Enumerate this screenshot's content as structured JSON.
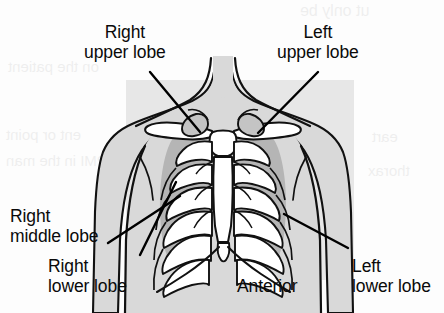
{
  "figure": {
    "view_label": "Anterior",
    "background_color": "#ffffff",
    "page_block_color": "#e3e3e3",
    "line_color": "#000000",
    "lung_shade_color": "#b9b9b9",
    "bone_fill_color": "#ffffff"
  },
  "labels": [
    {
      "id": "right-upper-lobe",
      "lines": [
        "Right",
        "upper lobe"
      ],
      "align": "center",
      "x": 84,
      "y": 22,
      "leader": {
        "from_x": 150,
        "from_y": 72,
        "to_x": 200,
        "to_y": 132
      }
    },
    {
      "id": "left-upper-lobe",
      "lines": [
        "Left",
        "upper lobe"
      ],
      "align": "center",
      "x": 277,
      "y": 22,
      "leader": {
        "from_x": 318,
        "from_y": 72,
        "to_x": 258,
        "to_y": 133
      }
    },
    {
      "id": "right-middle-lobe",
      "lines": [
        "Right",
        "middle lobe"
      ],
      "align": "left",
      "x": 10,
      "y": 206,
      "leader": {
        "from_x": 108,
        "from_y": 243,
        "to_x": 180,
        "to_y": 196
      }
    },
    {
      "id": "right-lower-lobe",
      "lines": [
        "Right",
        "lower lobe"
      ],
      "align": "left",
      "x": 48,
      "y": 256,
      "leader": {
        "from_x": 140,
        "from_y": 255,
        "to_x": 176,
        "to_y": 182
      }
    },
    {
      "id": "left-lower-lobe",
      "lines": [
        "Left",
        "lower lobe"
      ],
      "align": "left",
      "x": 352,
      "y": 256,
      "leader": {
        "from_x": 348,
        "from_y": 248,
        "to_x": 284,
        "to_y": 214
      }
    }
  ],
  "view_label": {
    "text": "Anterior",
    "x": 237,
    "y": 276
  },
  "ghost_text": [
    {
      "id": "ghost-top-right",
      "text": "ut only be",
      "x": 300,
      "y": 2,
      "size": 16
    },
    {
      "id": "ghost-upper-left",
      "text": "on the patient",
      "x": 8,
      "y": 58,
      "size": 15
    },
    {
      "id": "ghost-mid-left-1",
      "text": "ent or point",
      "x": 6,
      "y": 126,
      "size": 15
    },
    {
      "id": "ghost-mid-left-2",
      "text": "ring the PMI in the man",
      "x": 6,
      "y": 152,
      "size": 15
    },
    {
      "id": "ghost-mid-right",
      "text": "eart",
      "x": 372,
      "y": 128,
      "size": 15
    },
    {
      "id": "ghost-lower-right",
      "text": "thorax",
      "x": 368,
      "y": 162,
      "size": 15
    }
  ]
}
